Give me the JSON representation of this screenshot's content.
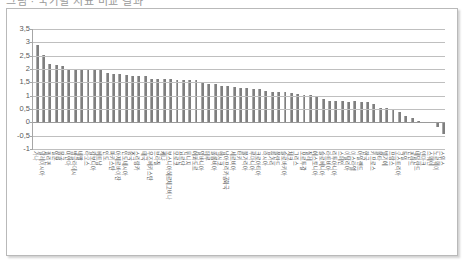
{
  "top_crop": {
    "text": "그림 · 국가별 지표 비교 결과"
  },
  "chart_data": {
    "type": "bar",
    "title": "",
    "subtitle": "",
    "xlabel": "",
    "ylabel": "",
    "ylim": [
      -1,
      3.5
    ],
    "ytick_labels": [
      "3,5",
      "3",
      "2,5",
      "2",
      "1,5",
      "1",
      "0,5",
      "0",
      "-0,5",
      "-1"
    ],
    "ytick_values": [
      3.5,
      3,
      2.5,
      2,
      1.5,
      1,
      0.5,
      0,
      -0.5,
      -1
    ],
    "grid": true,
    "legend": "none",
    "bar_color": "#7f7f7f",
    "decimal_separator": ",",
    "categories": [
      "가나",
      "말레이시아",
      "필리핀",
      "일본",
      "몽골",
      "미얀마",
      "방글라데시",
      "네팔",
      "라오스",
      "캄보디아",
      "베트남",
      "인도",
      "파키스탄",
      "아제르바이잔",
      "인도네시아",
      "중국",
      "스리랑카",
      "태국",
      "우즈베키스탄",
      "브라질",
      "케냐",
      "보스니아헤르체고비나",
      "모로코",
      "요르단",
      "튀니지",
      "에콰도르",
      "알바니아",
      "페루",
      "콜롬비아",
      "멕시코",
      "남아프리카공화국",
      "세르비아",
      "터키",
      "불가리아",
      "루마니아",
      "크로아티아",
      "러시아",
      "헝가리",
      "폴란드",
      "슬로바키아",
      "체코",
      "그리스",
      "포르투갈",
      "칠레",
      "에스토니아",
      "슬로베니아",
      "라트비아",
      "리투아니아",
      "스페인",
      "이탈리아",
      "이스라엘",
      "아일랜드",
      "한국",
      "키프로스",
      "몰타",
      "벨기에",
      "프랑스",
      "오스트리아",
      "독일",
      "핀란드",
      "네덜란드",
      "덴마크",
      "스웨덴",
      "노르웨이",
      "스위스"
    ],
    "values": [
      2.9,
      2.52,
      2.2,
      2.15,
      2.1,
      2.0,
      2.0,
      2.0,
      1.97,
      1.96,
      1.95,
      1.86,
      1.82,
      1.8,
      1.78,
      1.75,
      1.73,
      1.72,
      1.63,
      1.62,
      1.61,
      1.61,
      1.6,
      1.6,
      1.58,
      1.57,
      1.5,
      1.44,
      1.43,
      1.37,
      1.35,
      1.31,
      1.3,
      1.28,
      1.26,
      1.25,
      1.19,
      1.15,
      1.13,
      1.13,
      1.1,
      1.06,
      1.02,
      1.01,
      0.97,
      0.86,
      0.8,
      0.79,
      0.79,
      0.78,
      0.79,
      0.78,
      0.77,
      0.69,
      0.55,
      0.53,
      0.46,
      0.37,
      0.23,
      0.15,
      0.05,
      0.03,
      0.02,
      -0.18,
      -0.42
    ]
  }
}
